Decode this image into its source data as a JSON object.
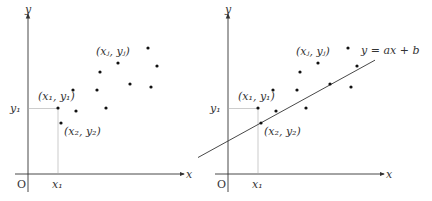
{
  "panels": [
    {
      "id": "scatter",
      "axis_x_label": "x",
      "axis_y_label": "y",
      "origin_label": "O",
      "tick_x_label": "x₁",
      "tick_y_label": "y₁",
      "point_labels": {
        "p1": "(x₁, y₁)",
        "p2": "(x₂, y₂)",
        "pj": "(xⱼ, yⱼ)"
      }
    },
    {
      "id": "regression",
      "axis_x_label": "x",
      "axis_y_label": "y",
      "origin_label": "O",
      "tick_x_label": "x₁",
      "tick_y_label": "y₁",
      "point_labels": {
        "p1": "(x₁, y₁)",
        "p2": "(x₂, y₂)",
        "pj": "(xⱼ, yⱼ)"
      },
      "line_label": "y = ax + b"
    }
  ],
  "points": [
    {
      "x": 1.0,
      "y": 2.2
    },
    {
      "x": 1.1,
      "y": 1.7
    },
    {
      "x": 1.5,
      "y": 2.8
    },
    {
      "x": 1.6,
      "y": 2.1
    },
    {
      "x": 2.3,
      "y": 2.8
    },
    {
      "x": 2.4,
      "y": 3.4
    },
    {
      "x": 2.6,
      "y": 2.2
    },
    {
      "x": 3.0,
      "y": 3.7
    },
    {
      "x": 3.4,
      "y": 3.0
    },
    {
      "x": 4.0,
      "y": 4.2
    },
    {
      "x": 4.1,
      "y": 2.9
    },
    {
      "x": 4.3,
      "y": 3.6
    }
  ],
  "fit_line": {
    "a": 0.55,
    "b": 1.1
  }
}
